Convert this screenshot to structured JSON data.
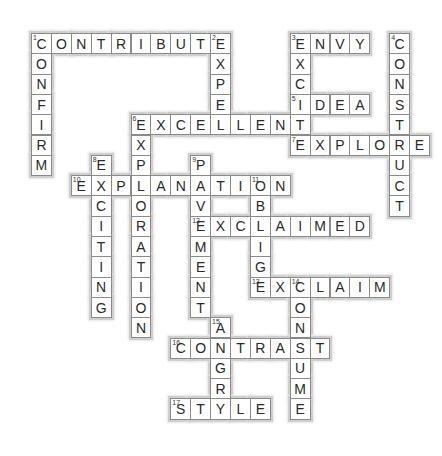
{
  "puzzle": {
    "grid": {
      "origin_x": 31,
      "origin_y": 33,
      "cell_w": 19.9,
      "cell_h": 20.3
    },
    "colors": {
      "border": "#8a8a8a",
      "halo": "#cfcfcf",
      "letter": "#2a2a2a",
      "background": "#ffffff"
    },
    "entries": [
      {
        "number": 1,
        "direction": "across",
        "answer": "CONTRIBUTE",
        "row": 0,
        "col": 0
      },
      {
        "number": 1,
        "direction": "down",
        "answer": "CONFIRM",
        "row": 0,
        "col": 0
      },
      {
        "number": 2,
        "direction": "down",
        "answer": "EXPEL",
        "row": 0,
        "col": 9
      },
      {
        "number": 3,
        "direction": "across",
        "answer": "ENVY",
        "row": 0,
        "col": 13
      },
      {
        "number": 3,
        "direction": "down",
        "answer": "EXCITE",
        "row": 0,
        "col": 13
      },
      {
        "number": 4,
        "direction": "down",
        "answer": "CONSTRUCT",
        "row": 0,
        "col": 18
      },
      {
        "number": 5,
        "direction": "across",
        "answer": "IDEA",
        "row": 3,
        "col": 13
      },
      {
        "number": 6,
        "direction": "across",
        "answer": "EXCELLENT",
        "row": 4,
        "col": 5
      },
      {
        "number": 6,
        "direction": "down",
        "answer": "EXPLORATION",
        "row": 4,
        "col": 5
      },
      {
        "number": 7,
        "direction": "across",
        "answer": "EXPLORE",
        "row": 5,
        "col": 13
      },
      {
        "number": 8,
        "direction": "down",
        "answer": "EXCITING",
        "row": 6,
        "col": 3
      },
      {
        "number": 9,
        "direction": "down",
        "answer": "PAVEMENT",
        "row": 6,
        "col": 8
      },
      {
        "number": 10,
        "direction": "across",
        "answer": "EXPLANATION",
        "row": 7,
        "col": 2
      },
      {
        "number": 11,
        "direction": "down",
        "answer": "OBLIGE",
        "row": 7,
        "col": 11
      },
      {
        "number": 12,
        "direction": "across",
        "answer": "EXCLAIMED",
        "row": 9,
        "col": 8
      },
      {
        "number": 13,
        "direction": "across",
        "answer": "EXCLAIM",
        "row": 12,
        "col": 11
      },
      {
        "number": 14,
        "direction": "down",
        "answer": "CONSUME",
        "row": 12,
        "col": 13
      },
      {
        "number": 15,
        "direction": "down",
        "answer": "ANGRY",
        "row": 14,
        "col": 9
      },
      {
        "number": 16,
        "direction": "across",
        "answer": "CONTRAST",
        "row": 15,
        "col": 7
      },
      {
        "number": 17,
        "direction": "across",
        "answer": "STYLE",
        "row": 18,
        "col": 7
      }
    ]
  }
}
